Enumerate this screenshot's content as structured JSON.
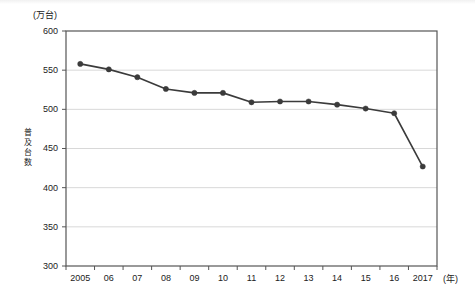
{
  "chart_data": {
    "type": "line",
    "title": "",
    "unit_label": "(万台)",
    "ylabel": "普及台数",
    "xlabel": "(年)",
    "categories": [
      "2005",
      "06",
      "07",
      "08",
      "09",
      "10",
      "11",
      "12",
      "13",
      "14",
      "15",
      "16",
      "2017"
    ],
    "values": [
      558,
      551,
      541,
      526,
      521,
      521,
      509,
      510,
      510,
      506,
      501,
      495,
      427
    ],
    "ylim": [
      300,
      600
    ],
    "yticks": [
      300,
      350,
      400,
      450,
      500,
      550,
      600
    ],
    "ytick_labels": [
      "300",
      "350",
      "400",
      "450",
      "500",
      "550",
      "600"
    ],
    "grid": true,
    "legend": "none",
    "series_color": "#3b3b3b",
    "marker": "circle",
    "marker_color": "#3b3b3b",
    "axis_color": "#555555",
    "grid_color": "#d8d8d8"
  },
  "axis": {
    "y_title_chars": [
      "普",
      "及",
      "台",
      "数"
    ]
  }
}
